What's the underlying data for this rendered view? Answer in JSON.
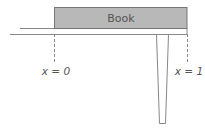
{
  "diagram": {
    "book_label": "Book",
    "marker_left_label": "x = 0",
    "marker_right_label": "x = 1",
    "colors": {
      "book_fill": "#b8b8b8",
      "line": "#777777",
      "text": "#555555"
    }
  }
}
